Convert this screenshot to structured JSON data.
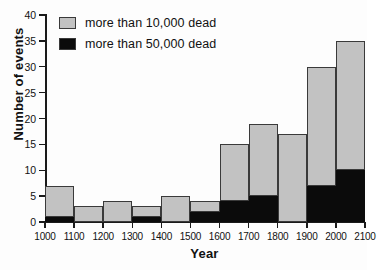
{
  "chart_data": {
    "type": "bar",
    "subtype": "stacked",
    "title": "",
    "xlabel": "Year",
    "ylabel": "Number of events",
    "xlim": [
      1000,
      2100
    ],
    "ylim": [
      0,
      40
    ],
    "xtick_labels": [
      "1000",
      "1100",
      "1200",
      "1300",
      "1400",
      "1500",
      "1600",
      "1700",
      "1800",
      "1900",
      "2000",
      "2100"
    ],
    "ytick_labels": [
      "0",
      "5",
      "10",
      "15",
      "20",
      "25",
      "30",
      "35",
      "40"
    ],
    "ytick_values": [
      0,
      5,
      10,
      15,
      20,
      25,
      30,
      35,
      40
    ],
    "grid": false,
    "legend_position": "top-left",
    "categories": [
      "1000-1100",
      "1100-1200",
      "1200-1300",
      "1300-1400",
      "1400-1500",
      "1500-1600",
      "1600-1700",
      "1700-1800",
      "1800-1900",
      "1900-2000",
      "2000-2100"
    ],
    "bin_starts": [
      1000,
      1100,
      1200,
      1300,
      1400,
      1500,
      1600,
      1700,
      1800,
      1900,
      2000
    ],
    "series": [
      {
        "name": "more than 50,000 dead",
        "color": "#0b0b0b",
        "values": [
          1,
          0,
          0,
          1,
          0,
          2,
          4,
          5,
          0,
          7,
          10
        ]
      },
      {
        "name": "more than 10,000 dead",
        "color": "#c2c2c2",
        "values": [
          6,
          3,
          4,
          2,
          5,
          2,
          11,
          14,
          17,
          23,
          25
        ]
      }
    ],
    "totals": [
      7,
      3,
      4,
      3,
      5,
      4,
      15,
      19,
      17,
      30,
      35
    ]
  },
  "legend": {
    "items": [
      {
        "label": "more than 10,000 dead",
        "swatch": "gray-swatch-icon",
        "color": "#c2c2c2"
      },
      {
        "label": "more than 50,000 dead",
        "swatch": "black-swatch-icon",
        "color": "#0b0b0b"
      }
    ]
  }
}
